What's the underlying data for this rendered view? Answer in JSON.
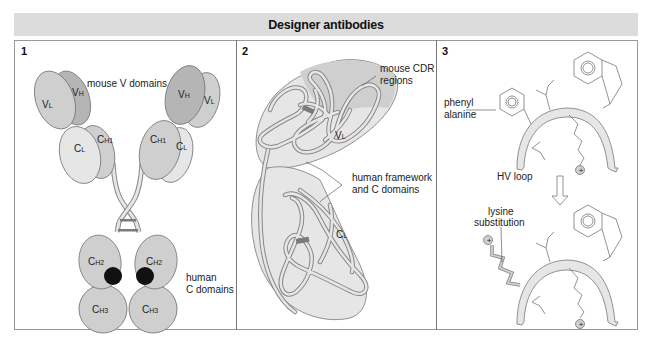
{
  "title": "Designer antibodies",
  "colors": {
    "title_bar_bg": "#dcdcdc",
    "domain_light": "#e6e6e6",
    "domain_mid": "#cfcfcf",
    "domain_dark": "#b5b5b5",
    "disulfide": "#7a7a7a",
    "carbohydrate": "#111111",
    "border": "#999999"
  },
  "panels": [
    {
      "number": "1",
      "labels": {
        "mouse_v_domains": "mouse V domains",
        "human_c_domains_line1": "human",
        "human_c_domains_line2": "C domains"
      },
      "domains": {
        "vl": {
          "main": "V",
          "sub": "L"
        },
        "vh": {
          "main": "V",
          "sub": "H"
        },
        "cl": {
          "main": "C",
          "sub": "L"
        },
        "ch1": {
          "main": "C",
          "sub": "H1"
        },
        "ch2": {
          "main": "C",
          "sub": "H2"
        },
        "ch3": {
          "main": "C",
          "sub": "H3"
        }
      }
    },
    {
      "number": "2",
      "labels": {
        "mouse_cdr_line1": "mouse CDR",
        "mouse_cdr_line2": "regions",
        "human_framework_line1": "human framework",
        "human_framework_line2": "and C domains",
        "vl": {
          "main": "V",
          "sub": "L"
        },
        "cl": {
          "main": "C",
          "sub": "L"
        }
      }
    },
    {
      "number": "3",
      "labels": {
        "phenylalanine_line1": "phenyl",
        "phenylalanine_line2": "alanine",
        "hv_loop": "HV loop",
        "lysine_line1": "lysine",
        "lysine_line2": "substitution",
        "plus": "+"
      }
    }
  ]
}
